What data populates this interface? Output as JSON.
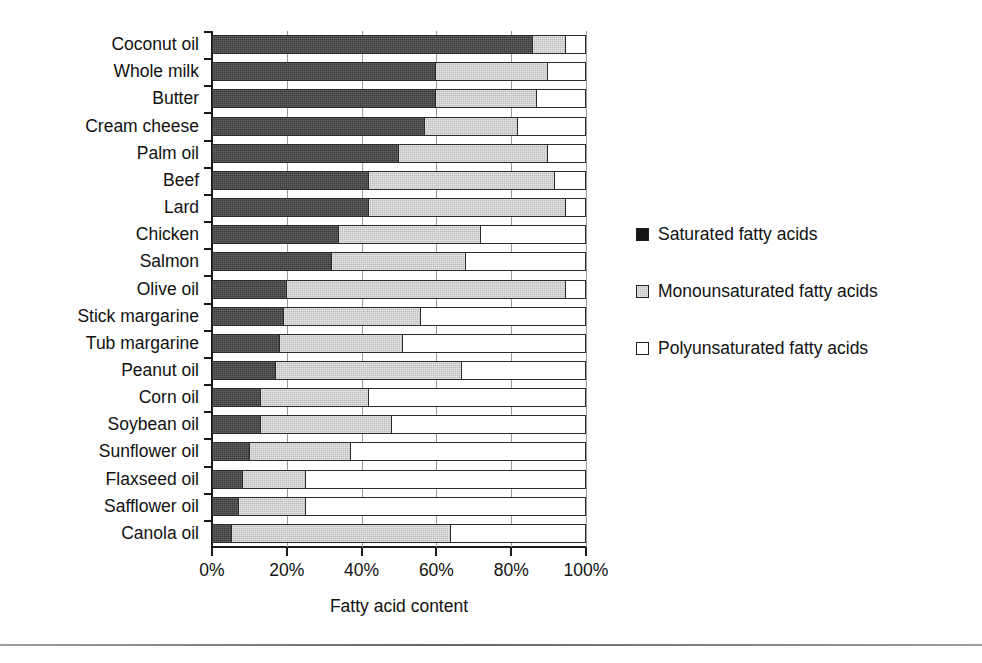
{
  "figure": {
    "top_remnant_text": "",
    "axis_title": "Fatty acid content",
    "x_tick_labels": [
      "0%",
      "20%",
      "40%",
      "60%",
      "80%",
      "100%"
    ],
    "x_tick_values": [
      0,
      20,
      40,
      60,
      80,
      100
    ]
  },
  "legend": {
    "items": [
      {
        "label": "Saturated fatty acids",
        "key": "saturated",
        "swatch": "filled-black-square-icon",
        "color": "#161616"
      },
      {
        "label": "Monounsaturated fatty acids",
        "key": "monounsaturated",
        "swatch": "gray-square-icon",
        "color": "#bdbdbd"
      },
      {
        "label": "Polyunsaturated fatty acids",
        "key": "polyunsaturated",
        "swatch": "white-square-icon",
        "color": "#ffffff"
      }
    ]
  },
  "chart_data": {
    "type": "bar",
    "orientation": "horizontal",
    "stacked": true,
    "normalized": true,
    "title": "",
    "xlabel": "Fatty acid content",
    "ylabel": "",
    "xlim": [
      0,
      100
    ],
    "xticks": [
      0,
      20,
      40,
      60,
      80,
      100
    ],
    "xticklabels": [
      "0%",
      "20%",
      "40%",
      "60%",
      "80%",
      "100%"
    ],
    "grid": "vertical",
    "legend_position": "right",
    "categories": [
      "Coconut oil",
      "Whole milk",
      "Butter",
      "Cream cheese",
      "Palm oil",
      "Beef",
      "Lard",
      "Chicken",
      "Salmon",
      "Olive oil",
      "Stick margarine",
      "Tub margarine",
      "Peanut oil",
      "Corn oil",
      "Soybean oil",
      "Sunflower oil",
      "Flaxseed oil",
      "Safflower oil",
      "Canola oil"
    ],
    "series": [
      {
        "name": "Saturated fatty acids",
        "color": "#3b3b3b",
        "values": [
          86,
          60,
          60,
          57,
          50,
          42,
          42,
          34,
          32,
          20,
          19,
          18,
          17,
          13,
          13,
          10,
          8,
          7,
          5
        ]
      },
      {
        "name": "Monounsaturated fatty acids",
        "color": "#bdbdbd",
        "values": [
          9,
          30,
          27,
          25,
          40,
          50,
          53,
          38,
          36,
          75,
          37,
          33,
          50,
          29,
          35,
          27,
          17,
          18,
          59
        ]
      },
      {
        "name": "Polyunsaturated fatty acids",
        "color": "#ffffff",
        "values": [
          5,
          10,
          13,
          18,
          10,
          8,
          5,
          28,
          32,
          5,
          44,
          49,
          33,
          58,
          52,
          63,
          75,
          75,
          36
        ]
      }
    ]
  }
}
